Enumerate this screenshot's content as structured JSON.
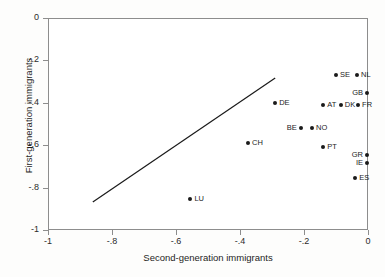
{
  "chart_data": {
    "type": "scatter",
    "title": "",
    "xlabel": "Second-generation immigrants",
    "ylabel": "First-generation immigrants",
    "xlim": [
      -1,
      0
    ],
    "ylim": [
      -1,
      0
    ],
    "xticks": [
      "-1",
      "-.8",
      "-.6",
      "-.4",
      "-.2",
      "0"
    ],
    "xtick_values": [
      -1,
      -0.8,
      -0.6,
      -0.4,
      -0.2,
      0
    ],
    "yticks": [
      "0",
      "-.2",
      "-.4",
      "-.6",
      "-.8",
      "-1"
    ],
    "ytick_values": [
      0,
      -0.2,
      -0.4,
      -0.6,
      -0.8,
      -1
    ],
    "grid": false,
    "legend": "none",
    "marker_color": "#1a1a1a",
    "frame_color": "#8d8d8d",
    "points": [
      {
        "label": "SE",
        "x": -0.1,
        "y": -0.27,
        "label_pos": "right"
      },
      {
        "label": "NL",
        "x": -0.034,
        "y": -0.27,
        "label_pos": "right"
      },
      {
        "label": "GB",
        "x": -0.003,
        "y": -0.354,
        "label_pos": "left"
      },
      {
        "label": "DE",
        "x": -0.29,
        "y": -0.4,
        "label_pos": "right"
      },
      {
        "label": "AT",
        "x": -0.14,
        "y": -0.41,
        "label_pos": "right"
      },
      {
        "label": "DK",
        "x": -0.085,
        "y": -0.41,
        "label_pos": "right"
      },
      {
        "label": "FR",
        "x": -0.031,
        "y": -0.41,
        "label_pos": "right"
      },
      {
        "label": "BE",
        "x": -0.21,
        "y": -0.52,
        "label_pos": "left"
      },
      {
        "label": "NO",
        "x": -0.175,
        "y": -0.52,
        "label_pos": "right"
      },
      {
        "label": "CH",
        "x": -0.375,
        "y": -0.59,
        "label_pos": "right"
      },
      {
        "label": "PT",
        "x": -0.14,
        "y": -0.61,
        "label_pos": "right"
      },
      {
        "label": "GR",
        "x": -0.003,
        "y": -0.645,
        "label_pos": "left"
      },
      {
        "label": "IE",
        "x": -0.003,
        "y": -0.685,
        "label_pos": "left"
      },
      {
        "label": "ES",
        "x": -0.04,
        "y": -0.755,
        "label_pos": "right"
      },
      {
        "label": "LU",
        "x": -0.555,
        "y": -0.855,
        "label_pos": "right"
      }
    ],
    "fit_line": {
      "x0": -0.86,
      "y0": -0.868,
      "x1": -0.29,
      "y1": -0.283
    }
  }
}
